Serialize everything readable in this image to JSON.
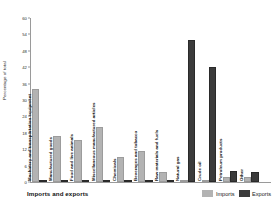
{
  "footer": {
    "title": "Imports and exports"
  },
  "legend": {
    "position": "bottom-right",
    "items": [
      {
        "label": "Imports",
        "color": "#b3b3b3"
      },
      {
        "label": "Exports",
        "color": "#3b3b3b"
      }
    ]
  },
  "axes": {
    "ylabel": "Percentage of total",
    "yticks": [
      0,
      6,
      12,
      18,
      24,
      30,
      36,
      42,
      48,
      54,
      60
    ],
    "ylim": [
      0,
      60
    ]
  },
  "chart_data": {
    "type": "bar",
    "title": "Imports and exports",
    "xlabel": "",
    "ylabel": "Percentage of total",
    "ylim": [
      0,
      60
    ],
    "yticks": [
      0,
      6,
      12,
      18,
      24,
      30,
      36,
      42,
      48,
      54,
      60
    ],
    "grid": false,
    "legend_position": "bottom-right",
    "categories": [
      "Machinery and transportation equipment",
      "Manufactured goods",
      "Food and live animals",
      "Miscellaneous manufactured articles",
      "Chemicals",
      "Beverages and tobacco",
      "Raw materials and fuels",
      "Natural gas",
      "Crude oil",
      "Petroleum products",
      "Other"
    ],
    "series": [
      {
        "name": "Imports",
        "color": "#b3b3b3",
        "values": [
          34,
          17,
          15.5,
          20,
          9,
          11.5,
          3.5,
          0.8,
          0.8,
          2,
          2
        ]
      },
      {
        "name": "Exports",
        "color": "#3b3b3b",
        "values": [
          0.8,
          0.8,
          0.8,
          0.8,
          0.8,
          0.8,
          0.8,
          52,
          42,
          4,
          3.5
        ]
      }
    ]
  }
}
